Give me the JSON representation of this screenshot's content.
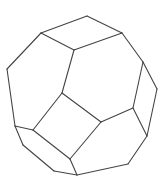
{
  "figure": {
    "stroke_color": "#444444",
    "background": "#ffffff",
    "vertices": {
      "A": [
        87,
        16
      ],
      "B": [
        41,
        33
      ],
      "C": [
        122,
        33
      ],
      "D": [
        74,
        50
      ],
      "E": [
        7,
        69
      ],
      "F": [
        143,
        62
      ],
      "G": [
        62,
        93
      ],
      "H": [
        157,
        89
      ],
      "I": [
        133,
        108
      ],
      "J": [
        101,
        122
      ],
      "K": [
        15,
        126
      ],
      "L": [
        33,
        130
      ],
      "M": [
        147,
        136
      ],
      "N": [
        23,
        145
      ],
      "O": [
        70,
        159
      ],
      "P": [
        128,
        164
      ],
      "Q": [
        54,
        171
      ],
      "R": [
        77,
        175
      ]
    },
    "edges": [
      [
        "A",
        "B"
      ],
      [
        "A",
        "C"
      ],
      [
        "B",
        "D"
      ],
      [
        "C",
        "D"
      ],
      [
        "B",
        "E"
      ],
      [
        "E",
        "K"
      ],
      [
        "K",
        "N"
      ],
      [
        "N",
        "Q"
      ],
      [
        "Q",
        "R"
      ],
      [
        "R",
        "P"
      ],
      [
        "P",
        "M"
      ],
      [
        "M",
        "H"
      ],
      [
        "H",
        "F"
      ],
      [
        "F",
        "C"
      ],
      [
        "D",
        "G"
      ],
      [
        "G",
        "L"
      ],
      [
        "G",
        "J"
      ],
      [
        "J",
        "O"
      ],
      [
        "L",
        "O"
      ],
      [
        "K",
        "L"
      ],
      [
        "O",
        "R"
      ],
      [
        "J",
        "I"
      ],
      [
        "I",
        "F"
      ],
      [
        "I",
        "M"
      ]
    ]
  }
}
